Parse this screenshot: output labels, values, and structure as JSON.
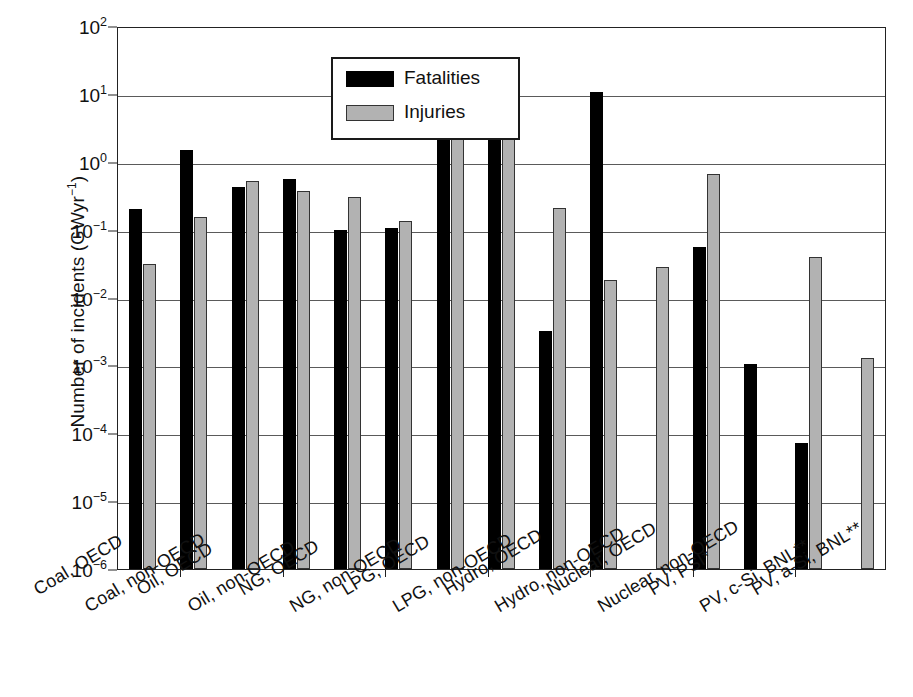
{
  "figure": {
    "background": "#ffffff",
    "frame_color": "#222222",
    "grid_color": "#5a5a5a"
  },
  "legend": {
    "entries": [
      {
        "label": "Fatalities",
        "color": "#000000",
        "key": "fatalities"
      },
      {
        "label": "Injuries",
        "color": "#b2b2b2",
        "key": "injuries"
      }
    ]
  },
  "axis": {
    "y_title_prefix": "Number of incidents (GWyr",
    "y_title_exponent": "−1",
    "y_title_suffix": ")",
    "y_ticks": [
      {
        "exp": "2",
        "base": "10",
        "value": 100
      },
      {
        "exp": "1",
        "base": "10",
        "value": 10
      },
      {
        "exp": "0",
        "base": "10",
        "value": 1
      },
      {
        "exp": "−1",
        "base": "10",
        "value": 0.1
      },
      {
        "exp": "−2",
        "base": "10",
        "value": 0.01
      },
      {
        "exp": "−3",
        "base": "10",
        "value": 0.001
      },
      {
        "exp": "−4",
        "base": "10",
        "value": 0.0001
      },
      {
        "exp": "−5",
        "base": "10",
        "value": 1e-05
      },
      {
        "exp": "−6",
        "base": "10",
        "value": 1e-06
      }
    ]
  },
  "footnote_ghost": {
    "left_text": "Energy in Other Energy Technologies",
    "visible": false
  },
  "chart_data": {
    "type": "bar",
    "title": "",
    "xlabel": "",
    "ylabel": "Number of incidents (GWyr−1)",
    "yscale": "log",
    "ylim": [
      1e-06,
      100
    ],
    "grid": true,
    "legend_position": "top-left-inside",
    "categories": [
      "Coal, OECD",
      "Coal, non-OECD",
      "Oil, OECD",
      "Oil, non-OECD",
      "NG, OECD",
      "NG, non-OECD",
      "LPG, OECD",
      "LPG, non-OECD",
      "Hydro, OECD",
      "Hydro, non-OECD",
      "Nuclear, OECD",
      "Nuclear, non-OECD",
      "PV, PSI*",
      "PV, c-Si, BNL**",
      "PV, a-Si, BNL**"
    ],
    "series": [
      {
        "name": "Fatalities",
        "color": "#000000",
        "values": [
          0.2,
          1.5,
          0.42,
          0.55,
          0.1,
          0.105,
          3.2,
          5.2,
          0.0032,
          10.5,
          null,
          0.055,
          0.00105,
          7.3e-05,
          null
        ]
      },
      {
        "name": "Injuries",
        "color": "#b2b2b2",
        "values": [
          0.031,
          0.155,
          0.52,
          0.37,
          0.3,
          0.135,
          14.0,
          7.5,
          0.21,
          0.018,
          0.028,
          0.66,
          null,
          0.04,
          0.0013
        ]
      }
    ]
  }
}
